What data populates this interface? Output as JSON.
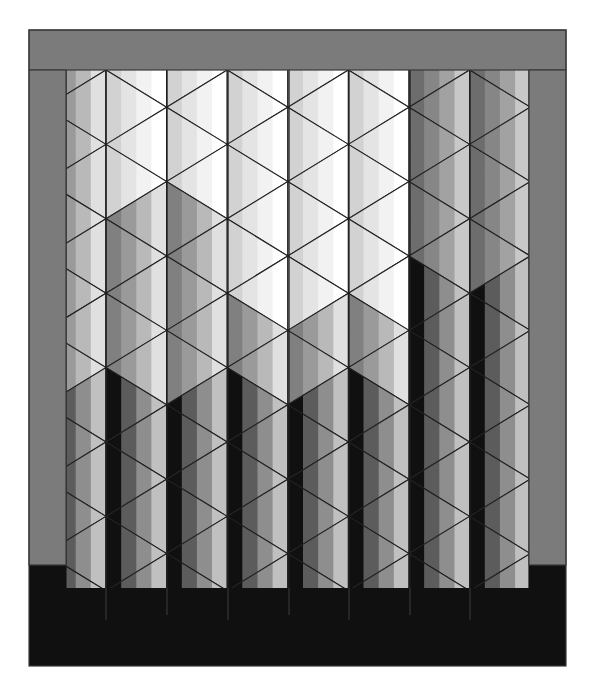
{
  "canvas": {
    "width": 596,
    "height": 695,
    "background": "#ffffff"
  },
  "quilt": {
    "frame": {
      "x": 29,
      "y": 30,
      "w": 537,
      "h": 636,
      "outline": "#3a3a3a"
    },
    "border": {
      "color": "#7b7b7b",
      "top": {
        "x": 29,
        "y": 30,
        "w": 537,
        "h": 40
      },
      "left": {
        "x": 29,
        "y": 70,
        "w": 37,
        "h": 495
      },
      "right": {
        "x": 529,
        "y": 70,
        "w": 37,
        "h": 495
      }
    },
    "bottom_band": {
      "x": 29,
      "y": 565,
      "w": 537,
      "h": 101,
      "color": "#101010",
      "line_color": "#3c3c3c"
    },
    "field": {
      "x": 66,
      "y": 70,
      "w": 463,
      "h": 495
    },
    "grid": {
      "column_lines_x": [
        66,
        106,
        167,
        228,
        289,
        349,
        410,
        470,
        529
      ],
      "origin_x": 106,
      "col_width": 60.6,
      "origin_y": 70,
      "half_row": 37.2,
      "line_color": "#202020",
      "stripes_per_triangle": 4,
      "pattern_bottom_y": 588
    },
    "palette": {
      "light": [
        "#ffffff",
        "#f2f2f2",
        "#e4e4e4",
        "#d2d2d2"
      ],
      "mid": [
        "#e0e0e0",
        "#b9b9b9",
        "#9a9a9a",
        "#808080"
      ],
      "dark": [
        "#c8c8c8",
        "#a2a2a2",
        "#868686",
        "#6d6d6d"
      ],
      "shadow": [
        "#c0c0c0",
        "#8e8e8e",
        "#5c5c5c",
        "#101010"
      ]
    },
    "shade_regions": [
      {
        "name": "light-upper-center",
        "x0": 106,
        "x1": 410,
        "y0": 70,
        "y1": 190,
        "tone": "light"
      },
      {
        "name": "light-center-column",
        "x0": 228,
        "x1": 410,
        "y0": 190,
        "y1": 330,
        "tone": "light"
      },
      {
        "name": "dark-right-upper",
        "x0": 410,
        "x1": 529,
        "y0": 70,
        "y1": 260,
        "tone": "dark"
      },
      {
        "name": "shadow-lower",
        "x0": 66,
        "x1": 529,
        "y0": 380,
        "y1": 600,
        "tone": "shadow"
      },
      {
        "name": "shadow-right-mid",
        "x0": 410,
        "x1": 529,
        "y0": 260,
        "y1": 380,
        "tone": "shadow"
      },
      {
        "name": "default",
        "x0": 0,
        "x1": 600,
        "y0": 0,
        "y1": 700,
        "tone": "mid"
      }
    ]
  }
}
